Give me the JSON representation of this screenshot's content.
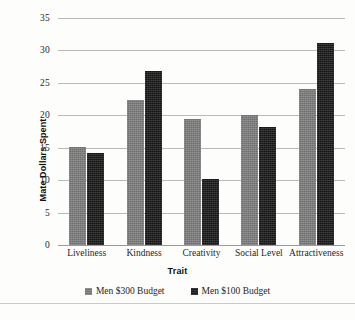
{
  "chart_data": {
    "type": "bar",
    "title": "",
    "subtitle": "",
    "xlabel": "Trait",
    "ylabel": "Mate Dollars Spent",
    "categories": [
      "Liveliness",
      "Kindness",
      "Creativity",
      "Social Level",
      "Attractiveness"
    ],
    "series": [
      {
        "name": "Men $300 Budget",
        "color": "#7d7d7d",
        "values": [
          15.1,
          22.3,
          19.4,
          20.0,
          24.0
        ]
      },
      {
        "name": "Men $100 Budget",
        "color": "#1b1b1b",
        "values": [
          14.2,
          26.8,
          10.2,
          18.2,
          31.2
        ]
      }
    ],
    "ylim": [
      0,
      35
    ],
    "yticks": [
      0,
      5,
      10,
      15,
      20,
      25,
      30,
      35
    ],
    "ytick_labels": [
      "0",
      "5",
      "10",
      "15",
      "20",
      "25",
      "30",
      "35"
    ],
    "grid": true,
    "grid_axis": "y",
    "legend_position": "bottom"
  },
  "axes": {
    "y_title": "Mate Dollars Spent",
    "x_title": "Trait"
  },
  "legend": {
    "items": [
      {
        "label": "Men $300 Budget"
      },
      {
        "label": "Men $100 Budget"
      }
    ]
  },
  "caption": {
    "text": ""
  },
  "colors": {
    "series_a": "#7d7d7d",
    "series_b": "#1b1b1b",
    "gridline": "#b9b9b9",
    "background": "#fdfdfb",
    "text": "#1f1f1f"
  }
}
